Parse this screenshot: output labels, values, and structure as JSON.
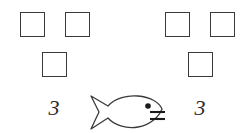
{
  "page": {
    "background_color": "#ffffff",
    "stroke_color": "#3a3a3a",
    "text_color": "#2b2b2b",
    "width": 250,
    "height": 133
  },
  "left_group": {
    "name": "left-square-group",
    "count_label": "3",
    "squares": [
      {
        "id": "left-square-top-1",
        "x": 20,
        "y": 12,
        "size": 25
      },
      {
        "id": "left-square-top-2",
        "x": 65,
        "y": 12,
        "size": 25
      },
      {
        "id": "left-square-bottom-1",
        "x": 42,
        "y": 52,
        "size": 25
      }
    ]
  },
  "right_group": {
    "name": "right-square-group",
    "count_label": "3",
    "squares": [
      {
        "id": "right-square-top-1",
        "x": 165,
        "y": 12,
        "size": 25
      },
      {
        "id": "right-square-top-2",
        "x": 210,
        "y": 12,
        "size": 25
      },
      {
        "id": "right-square-bottom-1",
        "x": 188,
        "y": 52,
        "size": 25
      }
    ]
  },
  "comparison_symbol": {
    "name": "fish-symbol",
    "shape": "fish-icon",
    "description": "outline fish facing right with eye and mouth lines",
    "eye_color": "#1a1a1a",
    "x": 88,
    "y": 93
  },
  "labels": {
    "left_numeral": "3",
    "right_numeral": "3"
  }
}
